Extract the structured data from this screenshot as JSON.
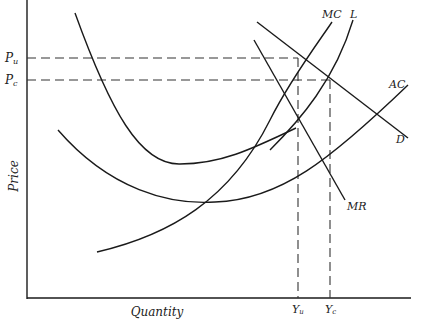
{
  "figure": {
    "type": "economics-diagram",
    "axes": {
      "x_label": "Quantity",
      "y_label": "Price"
    },
    "price_levels": [
      {
        "id": "pu",
        "label": "P",
        "subscript": "u"
      },
      {
        "id": "pc",
        "label": "P",
        "subscript": "c"
      }
    ],
    "quantity_levels": [
      {
        "id": "yu",
        "label": "Y",
        "subscript": "u"
      },
      {
        "id": "yc",
        "label": "Y",
        "subscript": "c"
      }
    ],
    "curves": [
      {
        "id": "mc",
        "label": "MC"
      },
      {
        "id": "l",
        "label": "L"
      },
      {
        "id": "ac",
        "label": "AC"
      },
      {
        "id": "d",
        "label": "D"
      },
      {
        "id": "mr",
        "label": "MR"
      }
    ]
  }
}
